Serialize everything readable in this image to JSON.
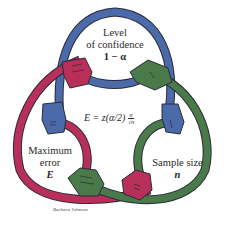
{
  "diagram": {
    "title": "",
    "nodes": [
      {
        "id": "confidence",
        "line1": "Level",
        "line2": "of confidence",
        "symbol": "1 − α",
        "color": "#4a6aaa"
      },
      {
        "id": "error",
        "line1": "Maximum",
        "line2": "error",
        "symbol": "E",
        "color": "#b8305a"
      },
      {
        "id": "sample",
        "line1": "Sample size",
        "symbol": "n",
        "color": "#4a7a4a"
      }
    ],
    "formula": {
      "lhs": "E = z(α/2)",
      "numerator": "σ",
      "denominator": "√n"
    },
    "signature": "Barbara Johnson",
    "colors": {
      "blue": "#4a6aaa",
      "magenta": "#b8305a",
      "green": "#4a7a4a",
      "outline": "#2b2b3a"
    }
  }
}
